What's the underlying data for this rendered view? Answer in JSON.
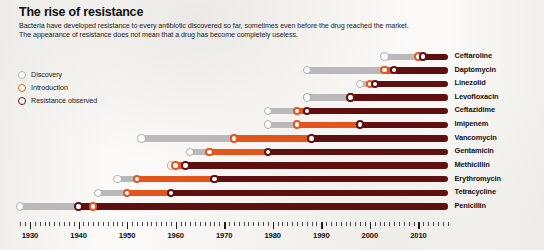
{
  "header": {
    "title": "The rise of resistance",
    "subtitle": "Bacteria have developed resistance to every antibiotic discovered so far, sometimes even before the drug reached the market.\nThe appearance of resistance does not mean that a drug has become completely useless."
  },
  "legend": {
    "items": [
      {
        "key": "discovery",
        "label": "Discovery",
        "color": "#b6b6b6"
      },
      {
        "key": "introduction",
        "label": "Introduction",
        "color": "#e4551f"
      },
      {
        "key": "resistance",
        "label": "Resistance observed",
        "color": "#6b1111"
      }
    ]
  },
  "colors": {
    "discovery": "#b9b9b9",
    "introduction": "#e2551d",
    "resistance": "#5e1010",
    "background": "#fbfaf8",
    "text": "#111111"
  },
  "chart_data": {
    "type": "bar",
    "title": "The rise of resistance",
    "subtitle": "Bacteria have developed resistance to every antibiotic discovered so far, sometimes even before the drug reached the market. The appearance of resistance does not mean that a drug has become completely useless.",
    "xlabel": "",
    "ylabel": "",
    "xlim": [
      1928,
      2016
    ],
    "tick_labels": [
      "1930",
      "1940",
      "1950",
      "1960",
      "1970",
      "1980",
      "1990",
      "2000",
      "2010"
    ],
    "tick_values": [
      1930,
      1940,
      1950,
      1960,
      1970,
      1980,
      1990,
      2000,
      2010
    ],
    "minor_tick_interval": 1,
    "grid": false,
    "legend_position": "left",
    "present_year": 2016,
    "categories": [
      "Ceftaroline",
      "Daptomycin",
      "Linezolid",
      "Levofloxacin",
      "Ceftazidime",
      "Imipenem",
      "Vancomycin",
      "Gentamicin",
      "Methicillin",
      "Erythromycin",
      "Tetracycline",
      "Penicillin"
    ],
    "series": [
      {
        "name": "Discovery",
        "values": [
          2003,
          1987,
          1998,
          1987,
          1979,
          1979,
          1953,
          1963,
          1959,
          1948,
          1944,
          1928
        ]
      },
      {
        "name": "Introduction",
        "values": [
          2010,
          2003,
          2000,
          1996,
          1985,
          1985,
          1972,
          1967,
          1960,
          1952,
          1950,
          1943
        ]
      },
      {
        "name": "Resistance observed",
        "values": [
          2011,
          2005,
          2001,
          1996,
          1987,
          1998,
          1988,
          1979,
          1962,
          1968,
          1959,
          1940
        ]
      }
    ],
    "rows": [
      {
        "drug": "Ceftaroline",
        "discovery": 2003,
        "introduction": 2010,
        "resistance": 2011
      },
      {
        "drug": "Daptomycin",
        "discovery": 1987,
        "introduction": 2003,
        "resistance": 2005
      },
      {
        "drug": "Linezolid",
        "discovery": 1998,
        "introduction": 2000,
        "resistance": 2001
      },
      {
        "drug": "Levofloxacin",
        "discovery": 1987,
        "introduction": 1996,
        "resistance": 1996
      },
      {
        "drug": "Ceftazidime",
        "discovery": 1979,
        "introduction": 1985,
        "resistance": 1987
      },
      {
        "drug": "Imipenem",
        "discovery": 1979,
        "introduction": 1985,
        "resistance": 1998
      },
      {
        "drug": "Vancomycin",
        "discovery": 1953,
        "introduction": 1972,
        "resistance": 1988
      },
      {
        "drug": "Gentamicin",
        "discovery": 1963,
        "introduction": 1967,
        "resistance": 1979
      },
      {
        "drug": "Methicillin",
        "discovery": 1959,
        "introduction": 1960,
        "resistance": 1962
      },
      {
        "drug": "Erythromycin",
        "discovery": 1948,
        "introduction": 1952,
        "resistance": 1968
      },
      {
        "drug": "Tetracycline",
        "discovery": 1944,
        "introduction": 1950,
        "resistance": 1959
      },
      {
        "drug": "Penicillin",
        "discovery": 1928,
        "introduction": 1943,
        "resistance": 1940
      }
    ]
  }
}
